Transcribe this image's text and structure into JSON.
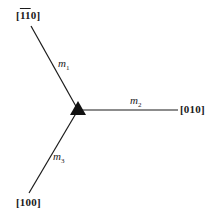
{
  "diagram": {
    "directions": {
      "top_left": {
        "open": "[",
        "d1": "1",
        "d2": "1",
        "d3": "0",
        "close": "]",
        "overbar": [
          true,
          true,
          false
        ]
      },
      "right": "[010]",
      "bottom_left": "[100]"
    },
    "mirrors": {
      "m1": {
        "base": "m",
        "sub": "1"
      },
      "m2": {
        "base": "m",
        "sub": "2"
      },
      "m3": {
        "base": "m",
        "sub": "3"
      }
    },
    "center_symbol": "triad-triangle",
    "colors": {
      "line": "#1a1a1a",
      "background": "#ffffff"
    }
  }
}
